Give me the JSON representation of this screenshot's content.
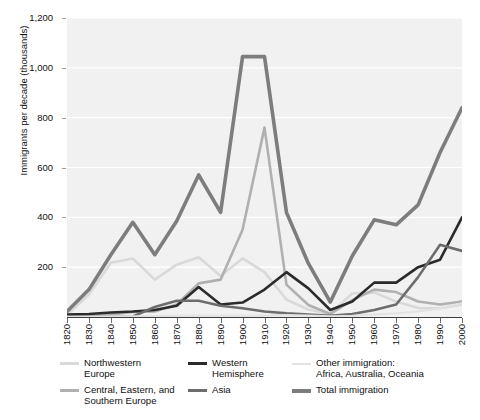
{
  "chart_data": {
    "type": "line",
    "title": "",
    "xlabel": "",
    "ylabel": "Immigrants per decade\n(thousands)",
    "ylim": [
      0,
      1200
    ],
    "xlim": [
      1820,
      2000
    ],
    "grid": true,
    "legend_position": "bottom",
    "y_ticks": [
      "1,200",
      "1,000",
      "800",
      "600",
      "400",
      "200"
    ],
    "y_tick_values": [
      1200,
      1000,
      800,
      600,
      400,
      200
    ],
    "x_ticks": [
      "1820",
      "1830",
      "1840",
      "1850",
      "1860",
      "1870",
      "1880",
      "1890",
      "1900",
      "1910",
      "1920",
      "1930",
      "1940",
      "1950",
      "1960",
      "1970",
      "1980",
      "1990",
      "2000"
    ],
    "x": [
      1820,
      1830,
      1840,
      1850,
      1860,
      1870,
      1880,
      1890,
      1900,
      1910,
      1920,
      1930,
      1940,
      1950,
      1960,
      1970,
      1980,
      1990,
      2000
    ],
    "series": [
      {
        "name": "Northwestern Europe",
        "color": "#d9d9d9",
        "width": 2.6,
        "values": [
          8,
          90,
          218,
          235,
          150,
          210,
          240,
          165,
          235,
          180,
          70,
          30,
          12,
          95,
          98,
          62,
          36,
          35,
          50
        ]
      },
      {
        "name": "Central, Eastern, and Southern Europe",
        "color": "#b0b0b0",
        "width": 2.6,
        "values": [
          2,
          4,
          10,
          20,
          22,
          50,
          135,
          150,
          350,
          760,
          130,
          48,
          12,
          68,
          110,
          100,
          62,
          50,
          62
        ]
      },
      {
        "name": "Western Hemisphere",
        "color": "#2b2b2b",
        "width": 2.6,
        "values": [
          10,
          12,
          18,
          22,
          28,
          45,
          120,
          50,
          58,
          110,
          180,
          115,
          28,
          62,
          138,
          138,
          200,
          230,
          400
        ]
      },
      {
        "name": "Asia",
        "color": "#6d6d6d",
        "width": 2.6,
        "values": [
          0,
          0,
          0,
          2,
          40,
          65,
          65,
          45,
          35,
          22,
          15,
          10,
          5,
          12,
          28,
          50,
          160,
          290,
          265
        ]
      },
      {
        "name": "Other immigration: Africa, Australia, Oceania",
        "color": "#e2e2e2",
        "width": 2.0,
        "values": [
          1,
          1,
          2,
          3,
          4,
          5,
          6,
          5,
          5,
          6,
          8,
          6,
          3,
          5,
          10,
          15,
          22,
          35,
          55
        ]
      },
      {
        "name": "Total immigration",
        "color": "#7d7d7d",
        "width": 3.6,
        "values": [
          22,
          110,
          250,
          380,
          250,
          385,
          570,
          420,
          1045,
          1045,
          420,
          215,
          60,
          245,
          390,
          370,
          450,
          660,
          840
        ]
      }
    ]
  },
  "legend": {
    "columns": [
      {
        "items": [
          {
            "label": "Northwestern\nEurope",
            "swatch": "legend-swatch-northwestern-europe",
            "style": "normal"
          },
          {
            "label": "Central, Eastern, and\nSouthern Europe",
            "swatch": "legend-swatch-central-eastern-southern-europe",
            "style": "normal"
          }
        ]
      },
      {
        "items": [
          {
            "label": "Western\nHemisphere",
            "swatch": "legend-swatch-western-hemisphere",
            "style": "normal"
          },
          {
            "label": "Asia",
            "swatch": "legend-swatch-asia",
            "style": "normal"
          }
        ]
      },
      {
        "items": [
          {
            "label": "Other immigration:\nAfrica, Australia, Oceania",
            "swatch": "legend-swatch-other-immigration",
            "style": "thin"
          },
          {
            "label": "Total immigration",
            "swatch": "legend-swatch-total-immigration",
            "style": "thick"
          }
        ]
      }
    ]
  },
  "colors": {
    "plot_background": "#f1f1f1",
    "gridline": "#ffffff",
    "axis": "#3d3d3d",
    "page_background": "#ffffff",
    "text": "#111111"
  }
}
